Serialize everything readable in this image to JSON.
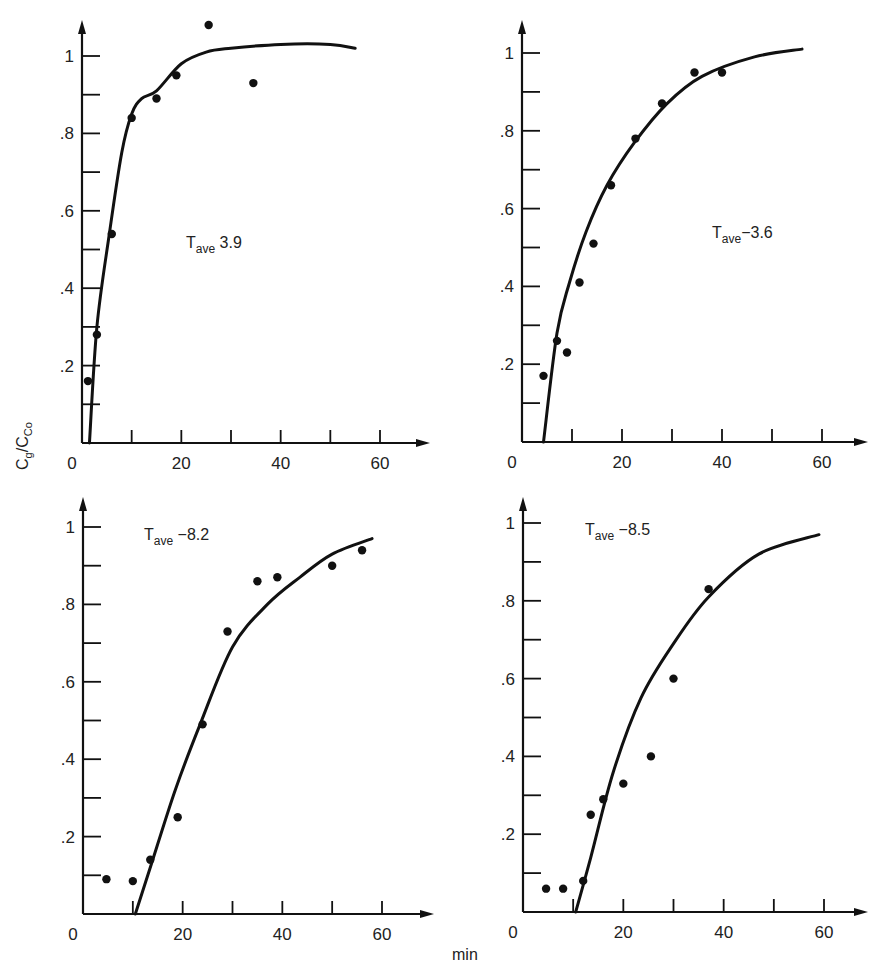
{
  "figure": {
    "y_axis_label": {
      "main": "C",
      "sub1": "g",
      "sep": "/C",
      "sub2": "Co"
    },
    "x_axis_label": "min"
  },
  "chart_data": [
    {
      "type": "scatter",
      "title": "",
      "annotation": {
        "prefix": "T",
        "sub": "ave",
        "value": " 3.9"
      },
      "xlabel": "min",
      "ylabel": "Cg/CCo",
      "xlim": [
        0,
        65
      ],
      "ylim": [
        0,
        1.1
      ],
      "x_ticks": [
        0,
        10,
        20,
        30,
        40,
        50,
        60
      ],
      "x_tick_labels": [
        "0",
        "",
        "20",
        "",
        "40",
        "",
        "60"
      ],
      "y_ticks": [
        0.1,
        0.2,
        0.3,
        0.4,
        0.5,
        0.6,
        0.7,
        0.8,
        0.9,
        1.0
      ],
      "y_tick_labels": [
        "",
        ".2",
        "",
        ".4",
        "",
        ".6",
        "",
        ".8",
        "",
        "1"
      ],
      "grid": false,
      "points": [
        [
          1.2,
          0.16
        ],
        [
          3,
          0.28
        ],
        [
          6,
          0.54
        ],
        [
          10,
          0.84
        ],
        [
          15,
          0.89
        ],
        [
          19,
          0.95
        ],
        [
          25.5,
          1.08
        ],
        [
          34.5,
          0.93
        ]
      ],
      "fit_curve": [
        [
          1.5,
          0
        ],
        [
          3,
          0.3
        ],
        [
          5.5,
          0.54
        ],
        [
          8,
          0.75
        ],
        [
          10,
          0.85
        ],
        [
          12,
          0.89
        ],
        [
          15,
          0.91
        ],
        [
          20,
          0.98
        ],
        [
          25,
          1.01
        ],
        [
          30,
          1.02
        ],
        [
          40,
          1.03
        ],
        [
          50,
          1.03
        ],
        [
          55,
          1.02
        ]
      ]
    },
    {
      "type": "scatter",
      "title": "",
      "annotation": {
        "prefix": "T",
        "sub": "ave",
        "value": "−3.6"
      },
      "xlabel": "min",
      "ylabel": "Cg/CCo",
      "xlim": [
        0,
        65
      ],
      "ylim": [
        0,
        1.1
      ],
      "x_ticks": [
        0,
        10,
        20,
        30,
        40,
        50,
        60
      ],
      "x_tick_labels": [
        "0",
        "",
        "20",
        "",
        "40",
        "",
        "60"
      ],
      "y_ticks": [
        0.1,
        0.2,
        0.3,
        0.4,
        0.5,
        0.6,
        0.7,
        0.8,
        0.9,
        1.0
      ],
      "y_tick_labels": [
        "",
        ".2",
        "",
        ".4",
        "",
        ".6",
        "",
        ".8",
        "",
        "1"
      ],
      "grid": false,
      "points": [
        [
          4.3,
          0.17
        ],
        [
          7,
          0.26
        ],
        [
          9,
          0.23
        ],
        [
          11.5,
          0.41
        ],
        [
          14.3,
          0.51
        ],
        [
          17.8,
          0.66
        ],
        [
          22.7,
          0.78
        ],
        [
          28,
          0.87
        ],
        [
          34.5,
          0.95
        ],
        [
          40,
          0.95
        ]
      ],
      "fit_curve": [
        [
          4.3,
          0
        ],
        [
          7,
          0.28
        ],
        [
          9.5,
          0.41
        ],
        [
          12.8,
          0.54
        ],
        [
          17,
          0.66
        ],
        [
          22.5,
          0.77
        ],
        [
          29,
          0.87
        ],
        [
          36,
          0.94
        ],
        [
          46.5,
          0.99
        ],
        [
          56,
          1.01
        ]
      ]
    },
    {
      "type": "scatter",
      "title": "",
      "annotation": {
        "prefix": "T",
        "sub": "ave",
        "value": " −8.2"
      },
      "xlabel": "min",
      "ylabel": "Cg/CCo",
      "xlim": [
        0,
        65
      ],
      "ylim": [
        0,
        1.1
      ],
      "x_ticks": [
        0,
        10,
        20,
        30,
        40,
        50,
        60
      ],
      "x_tick_labels": [
        "0",
        "",
        "20",
        "",
        "40",
        "",
        "60"
      ],
      "y_ticks": [
        0.1,
        0.2,
        0.3,
        0.4,
        0.5,
        0.6,
        0.7,
        0.8,
        0.9,
        1.0
      ],
      "y_tick_labels": [
        "",
        ".2",
        "",
        ".4",
        "",
        ".6",
        "",
        ".8",
        "",
        "1"
      ],
      "grid": false,
      "points": [
        [
          4.7,
          0.09
        ],
        [
          10,
          0.085
        ],
        [
          13.5,
          0.14
        ],
        [
          19,
          0.25
        ],
        [
          24,
          0.49
        ],
        [
          29,
          0.73
        ],
        [
          35,
          0.86
        ],
        [
          39,
          0.87
        ],
        [
          50,
          0.9
        ],
        [
          56,
          0.94
        ]
      ],
      "fit_curve": [
        [
          10.5,
          0
        ],
        [
          13.5,
          0.12
        ],
        [
          18.5,
          0.32
        ],
        [
          23.5,
          0.49
        ],
        [
          30,
          0.69
        ],
        [
          37,
          0.8
        ],
        [
          43.5,
          0.87
        ],
        [
          50,
          0.93
        ],
        [
          58,
          0.97
        ]
      ]
    },
    {
      "type": "scatter",
      "title": "",
      "annotation": {
        "prefix": "T",
        "sub": "ave",
        "value": " −8.5"
      },
      "xlabel": "min",
      "ylabel": "Cg/CCo",
      "xlim": [
        0,
        65
      ],
      "ylim": [
        0,
        1.1
      ],
      "x_ticks": [
        0,
        10,
        20,
        30,
        40,
        50,
        60
      ],
      "x_tick_labels": [
        "0",
        "",
        "20",
        "",
        "40",
        "",
        "60"
      ],
      "y_ticks": [
        0.1,
        0.2,
        0.3,
        0.4,
        0.5,
        0.6,
        0.7,
        0.8,
        0.9,
        1.0
      ],
      "y_tick_labels": [
        "",
        ".2",
        "",
        ".4",
        "",
        ".6",
        "",
        ".8",
        "",
        "1"
      ],
      "grid": false,
      "points": [
        [
          4.6,
          0.06
        ],
        [
          8,
          0.06
        ],
        [
          12,
          0.08
        ],
        [
          13.5,
          0.25
        ],
        [
          16,
          0.29
        ],
        [
          20,
          0.33
        ],
        [
          25.5,
          0.4
        ],
        [
          30,
          0.6
        ],
        [
          37,
          0.83
        ]
      ],
      "fit_curve": [
        [
          10.5,
          0
        ],
        [
          13.5,
          0.14
        ],
        [
          18,
          0.36
        ],
        [
          23.5,
          0.55
        ],
        [
          30,
          0.69
        ],
        [
          37,
          0.81
        ],
        [
          47,
          0.92
        ],
        [
          59,
          0.97
        ]
      ]
    }
  ]
}
